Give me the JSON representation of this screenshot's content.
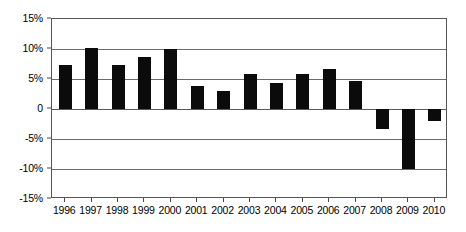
{
  "chart_data": {
    "type": "bar",
    "title": "",
    "subtitle": "",
    "xlabel": "",
    "ylabel": "",
    "categories": [
      "1996",
      "1997",
      "1998",
      "1999",
      "2000",
      "2001",
      "2002",
      "2003",
      "2004",
      "2005",
      "2006",
      "2007",
      "2008",
      "2009",
      "2010"
    ],
    "values": [
      7.4,
      10.2,
      7.4,
      8.6,
      10.0,
      3.8,
      3.0,
      5.9,
      4.4,
      5.9,
      6.7,
      4.7,
      -3.3,
      -10.0,
      -2.0
    ],
    "series": [
      {
        "name": "",
        "values": [
          7.4,
          10.2,
          7.4,
          8.6,
          10.0,
          3.8,
          3.0,
          5.9,
          4.4,
          5.9,
          6.7,
          4.7,
          -3.3,
          -10.0,
          -2.0
        ]
      }
    ],
    "ylim": [
      -15,
      15
    ],
    "ytick_values": [
      15,
      10,
      5,
      0,
      -5,
      -10,
      -15
    ],
    "ytick_labels": [
      "15%",
      "10%",
      "5%",
      "0",
      "-5%",
      "-10%",
      "-15%"
    ],
    "xtick_labels": [
      "1996",
      "1997",
      "1998",
      "1999",
      "2000",
      "2001",
      "2002",
      "2003",
      "2004",
      "2005",
      "2006",
      "2007",
      "2008",
      "2009",
      "2010"
    ],
    "grid": true,
    "grid_axis": "y",
    "legend": false,
    "legend_position": "none",
    "bar_color": "#0b0b0b",
    "grid_color": "#6b6b6b",
    "frame_color": "#555555",
    "background_color": "#ffffff",
    "annotations": []
  }
}
